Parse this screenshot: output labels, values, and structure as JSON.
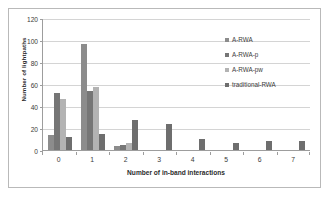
{
  "chart_data": {
    "type": "bar",
    "title": "",
    "xlabel": "Number of in-band interactions",
    "ylabel": "Number of lightpaths",
    "categories": [
      "0",
      "1",
      "2",
      "3",
      "4",
      "5",
      "6",
      "7"
    ],
    "ylim": [
      0,
      120
    ],
    "yticks": [
      0,
      20,
      40,
      60,
      80,
      100,
      120
    ],
    "grid": true,
    "legend_position": "top-right",
    "series": [
      {
        "name": "A-RWA",
        "color": "#8c8c8c",
        "values": [
          14,
          96,
          4,
          0,
          0,
          0,
          0,
          0
        ]
      },
      {
        "name": "A-RWA-p",
        "color": "#767676",
        "values": [
          52,
          54,
          5,
          0,
          0,
          0,
          0,
          0
        ]
      },
      {
        "name": "A-RWA-pw",
        "color": "#b3b3b3",
        "values": [
          46,
          57,
          6,
          0,
          0,
          0,
          0,
          0
        ]
      },
      {
        "name": "traditional-RWA",
        "color": "#6e6e6e",
        "values": [
          12,
          15,
          27,
          24,
          10,
          6,
          8,
          8
        ]
      }
    ]
  }
}
